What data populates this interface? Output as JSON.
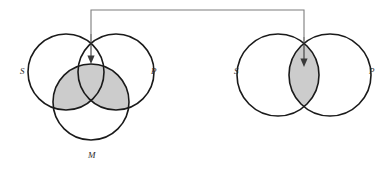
{
  "figure": {
    "type": "venn-diagram-pair",
    "background_color": "#ffffff",
    "stroke_color": "#1a1a1a",
    "shade_color": "#cccccc",
    "connector_color": "#7d7d7d",
    "arrow_color": "#3a3a3a"
  },
  "left_diagram": {
    "name": "three-circle-venn",
    "labels": {
      "subject": "S",
      "predicate": "P",
      "middle": "M"
    },
    "circles": [
      {
        "id": "S",
        "cx": 66,
        "cy": 72,
        "r": 38
      },
      {
        "id": "P",
        "cx": 116,
        "cy": 72,
        "r": 38
      },
      {
        "id": "M",
        "cx": 91,
        "cy": 102,
        "r": 38
      }
    ],
    "label_positions": [
      {
        "id": "S",
        "x": 20,
        "y": 74
      },
      {
        "id": "P",
        "x": 151,
        "y": 74
      },
      {
        "id": "M",
        "x": 88,
        "y": 158
      }
    ],
    "shaded_description": "upper region of circle M (M intersect S, M intersect P, and M intersect S intersect P)",
    "arrow_target": {
      "x": 91,
      "y": 63
    }
  },
  "right_diagram": {
    "name": "two-circle-venn",
    "labels": {
      "subject": "S",
      "predicate": "P"
    },
    "circles": [
      {
        "id": "S",
        "cx": 278,
        "cy": 75,
        "r": 41
      },
      {
        "id": "P",
        "cx": 330,
        "cy": 75,
        "r": 41
      }
    ],
    "label_positions": [
      {
        "id": "S",
        "x": 234,
        "y": 74
      },
      {
        "id": "P",
        "x": 369,
        "y": 74
      }
    ],
    "shaded_description": "lens region S intersect P",
    "arrow_target": {
      "x": 304,
      "y": 66
    }
  },
  "connector": {
    "name": "bracket-connector",
    "description": "horizontal bracket joining the two diagrams with downward arrows",
    "top_y": 10,
    "left_x": 91,
    "right_x": 304
  }
}
